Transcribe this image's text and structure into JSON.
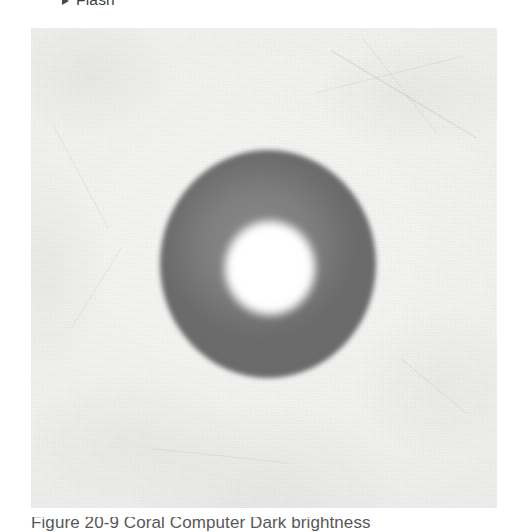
{
  "page": {
    "background_color": "#ffffff",
    "width": 518,
    "height": 532
  },
  "topline": {
    "marker_icon": "triangle-right-icon",
    "label": "Flash"
  },
  "figure": {
    "image_name": "annulus-ring-photograph",
    "colors": {
      "background": "#f4f4f3",
      "ring": "#7a7a7a",
      "center": "#ffffff"
    },
    "caption": "Figure 20-9  Coral Computer Dark brightness"
  }
}
